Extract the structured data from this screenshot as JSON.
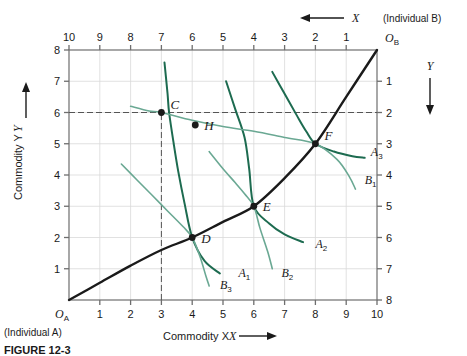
{
  "figure": {
    "type": "edgeworth-box-diagram",
    "caption": "FIGURE 12-3",
    "individual_a_label": "(Individual A)",
    "individual_b_label": "(Individual B)",
    "x_axis_title": "Commodity X",
    "y_axis_title": "Commodity Y",
    "top_arrow_label": "X",
    "right_arrow_label": "Y",
    "origin_a": "O",
    "origin_a_sub": "A",
    "origin_b": "O",
    "origin_b_sub": "B"
  },
  "colors": {
    "curve_a": "#1d6b50",
    "curve_b": "#6aa893",
    "contract_curve": "#1a1a1a",
    "grid": "#d9d9d9",
    "axis": "#6e6e6e",
    "dashed": "#555555",
    "background": "#ffffff"
  },
  "chart_data": {
    "type": "scatter",
    "title": "",
    "xlabel": "Commodity X",
    "ylabel": "Commodity Y",
    "xlim": [
      0,
      10
    ],
    "ylim": [
      0,
      8
    ],
    "grid": true,
    "legend": "none",
    "bottom_ticks": [
      "1",
      "2",
      "3",
      "4",
      "5",
      "6",
      "7",
      "8",
      "9",
      "10"
    ],
    "left_ticks": [
      "1",
      "2",
      "3",
      "4",
      "5",
      "6",
      "7",
      "8"
    ],
    "top_ticks": [
      "10",
      "9",
      "8",
      "7",
      "6",
      "5",
      "4",
      "3",
      "2",
      "1"
    ],
    "right_ticks": [
      "1",
      "2",
      "3",
      "4",
      "5",
      "6",
      "7",
      "8"
    ],
    "points": [
      {
        "label": "C",
        "x": 3,
        "y": 6,
        "filled": true
      },
      {
        "label": "H",
        "x": 4.1,
        "y": 5.6,
        "filled": true
      },
      {
        "label": "D",
        "x": 4,
        "y": 2,
        "filled": true
      },
      {
        "label": "E",
        "x": 6,
        "y": 3,
        "filled": true
      },
      {
        "label": "F",
        "x": 8,
        "y": 5,
        "filled": true
      }
    ],
    "curve_labels": [
      {
        "label": "A",
        "sub": "1",
        "x": 5.5,
        "y": 0.75
      },
      {
        "label": "A",
        "sub": "2",
        "x": 8.0,
        "y": 1.65
      },
      {
        "label": "A",
        "sub": "3",
        "x": 9.8,
        "y": 4.6
      },
      {
        "label": "B",
        "sub": "1",
        "x": 9.6,
        "y": 3.7
      },
      {
        "label": "B",
        "sub": "2",
        "x": 6.9,
        "y": 0.75
      },
      {
        "label": "B",
        "sub": "3",
        "x": 4.9,
        "y": 0.35
      }
    ],
    "series": [
      {
        "name": "A1",
        "owner": "A",
        "type": "indifference-curve",
        "points": [
          [
            3.1,
            7.6
          ],
          [
            3.2,
            6.6
          ],
          [
            3.25,
            6.0
          ],
          [
            3.4,
            5.0
          ],
          [
            3.55,
            4.1
          ],
          [
            3.75,
            3.1
          ],
          [
            4.0,
            2.0
          ],
          [
            4.4,
            1.25
          ],
          [
            4.9,
            0.85
          ]
        ]
      },
      {
        "name": "A2",
        "owner": "A",
        "type": "indifference-curve",
        "points": [
          [
            5.1,
            7.0
          ],
          [
            5.4,
            6.1
          ],
          [
            5.7,
            5.2
          ],
          [
            5.85,
            4.2
          ],
          [
            6.0,
            3.0
          ],
          [
            6.5,
            2.45
          ],
          [
            7.0,
            2.1
          ],
          [
            7.6,
            1.85
          ]
        ]
      },
      {
        "name": "A3",
        "owner": "A",
        "type": "indifference-curve",
        "points": [
          [
            6.6,
            7.3
          ],
          [
            7.0,
            6.6
          ],
          [
            7.4,
            5.9
          ],
          [
            7.7,
            5.4
          ],
          [
            8.0,
            5.0
          ],
          [
            8.6,
            4.75
          ],
          [
            9.2,
            4.6
          ],
          [
            9.6,
            4.55
          ]
        ]
      },
      {
        "name": "B1",
        "owner": "B",
        "type": "indifference-curve",
        "points": [
          [
            2.0,
            6.2
          ],
          [
            2.6,
            6.05
          ],
          [
            3.0,
            6.0
          ],
          [
            4.0,
            5.75
          ],
          [
            5.0,
            5.55
          ],
          [
            6.0,
            5.4
          ],
          [
            7.0,
            5.2
          ],
          [
            8.0,
            5.0
          ],
          [
            8.7,
            4.5
          ],
          [
            9.1,
            3.95
          ],
          [
            9.3,
            3.55
          ]
        ]
      },
      {
        "name": "B2",
        "owner": "B",
        "type": "indifference-curve",
        "points": [
          [
            4.55,
            4.75
          ],
          [
            5.0,
            4.2
          ],
          [
            5.4,
            3.75
          ],
          [
            5.7,
            3.4
          ],
          [
            6.0,
            3.0
          ],
          [
            6.2,
            2.3
          ],
          [
            6.45,
            1.55
          ],
          [
            6.6,
            1.0
          ]
        ]
      },
      {
        "name": "B3",
        "owner": "B",
        "type": "indifference-curve",
        "points": [
          [
            1.7,
            4.35
          ],
          [
            2.2,
            3.85
          ],
          [
            2.7,
            3.35
          ],
          [
            3.2,
            2.85
          ],
          [
            3.7,
            2.35
          ],
          [
            4.0,
            2.0
          ],
          [
            4.25,
            1.4
          ],
          [
            4.45,
            0.75
          ],
          [
            4.55,
            0.45
          ]
        ]
      },
      {
        "name": "contract-curve",
        "owner": "both",
        "type": "contract-curve",
        "points": [
          [
            0,
            0
          ],
          [
            1,
            0.55
          ],
          [
            2,
            1.1
          ],
          [
            3,
            1.6
          ],
          [
            4,
            2.0
          ],
          [
            5,
            2.5
          ],
          [
            6,
            3.0
          ],
          [
            7,
            3.9
          ],
          [
            8,
            5.0
          ],
          [
            9,
            6.5
          ],
          [
            10,
            8.0
          ]
        ]
      }
    ],
    "reference_lines": [
      {
        "name": "horizontal-dashed-at-y6",
        "orientation": "horizontal",
        "value": 6,
        "from": 0,
        "to": 10
      },
      {
        "name": "vertical-dashed-at-x3",
        "orientation": "vertical",
        "value": 3,
        "from": 0,
        "to": 6
      }
    ]
  }
}
